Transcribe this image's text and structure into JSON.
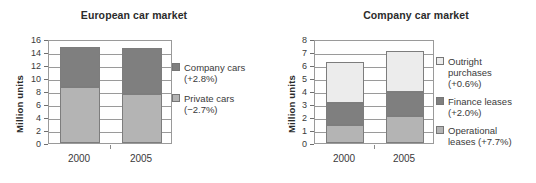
{
  "chart_data": [
    {
      "type": "bar",
      "subtype": "stacked",
      "title": "European car market",
      "xlabel": "",
      "ylabel": "Million units",
      "categories": [
        "2000",
        "2005"
      ],
      "ylim": [
        0,
        16
      ],
      "yticks": [
        0,
        2,
        4,
        6,
        8,
        10,
        12,
        14,
        16
      ],
      "grid": true,
      "legend_position": "right",
      "series": [
        {
          "name": "Private cars (−2.7%)",
          "legend_label": "Private cars (−2.7%)",
          "color": "#b4b4b4",
          "values": [
            8.6,
            7.5
          ]
        },
        {
          "name": "Company cars (+2.8%)",
          "legend_label": "Company cars\n(+2.8%)",
          "color": "#7f7f7f",
          "values": [
            6.2,
            7.1
          ]
        }
      ],
      "totals": [
        14.8,
        14.6
      ]
    },
    {
      "type": "bar",
      "subtype": "stacked",
      "title": "Company car market",
      "xlabel": "",
      "ylabel": "Million units",
      "categories": [
        "2000",
        "2005"
      ],
      "ylim": [
        0,
        8
      ],
      "yticks": [
        0,
        1,
        2,
        3,
        4,
        5,
        6,
        7,
        8
      ],
      "grid": true,
      "legend_position": "right",
      "series": [
        {
          "name": "Operational leases (+7.7%)",
          "legend_label": "Operational\nleases (+7.7%)",
          "color": "#b4b4b4",
          "values": [
            1.4,
            2.05
          ]
        },
        {
          "name": "Finance leases (+2.0%)",
          "legend_label": "Finance leases\n(+2.0%)",
          "color": "#7f7f7f",
          "values": [
            1.7,
            1.85
          ]
        },
        {
          "name": "Outright purchases (+0.6%)",
          "legend_label": "Outright\npurchases\n(+0.6%)",
          "color": "#ececec",
          "values": [
            3.1,
            3.15
          ]
        }
      ],
      "totals": [
        6.2,
        7.05
      ]
    }
  ],
  "left_chart": {
    "title": "European car market",
    "ylabel": "Million units",
    "yticks": [
      "16",
      "14",
      "12",
      "10",
      "8",
      "6",
      "4",
      "2",
      "0"
    ],
    "xticks": [
      "2000",
      "2005"
    ],
    "legend": [
      {
        "label": "Company cars\n(+2.8%)",
        "color": "#7f7f7f"
      },
      {
        "label": "Private cars (−2.7%)",
        "color": "#b4b4b4"
      }
    ]
  },
  "right_chart": {
    "title": "Company car market",
    "ylabel": "Million units",
    "yticks": [
      "8",
      "7",
      "6",
      "5",
      "4",
      "3",
      "2",
      "1",
      "0"
    ],
    "xticks": [
      "2000",
      "2005"
    ],
    "legend": [
      {
        "label": "Outright\npurchases\n(+0.6%)",
        "color": "#ececec"
      },
      {
        "label": "Finance leases\n(+2.0%)",
        "color": "#7f7f7f"
      },
      {
        "label": "Operational\nleases (+7.7%)",
        "color": "#b4b4b4"
      }
    ]
  }
}
